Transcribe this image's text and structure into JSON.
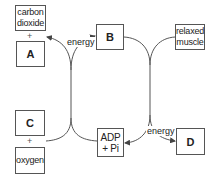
{
  "diagram": {
    "boxes": {
      "carbon_dioxide": {
        "line1": "carbon",
        "line2": "dioxide"
      },
      "a": {
        "label": "A"
      },
      "b": {
        "label": "B"
      },
      "relaxed_muscle": {
        "line1": "relaxed",
        "line2": "muscle"
      },
      "c": {
        "label": "C"
      },
      "oxygen": {
        "label": "oxygen"
      },
      "adp_pi": {
        "line1": "ADP",
        "line2": "+ Pi"
      },
      "d": {
        "label": "D"
      }
    },
    "plus_signs": {
      "top_left": "+",
      "bottom_left": "+"
    },
    "energy_labels": {
      "upper": "energy",
      "lower": "energy"
    },
    "colors": {
      "line": "#555555",
      "text": "#222222",
      "background": "#ffffff"
    }
  }
}
